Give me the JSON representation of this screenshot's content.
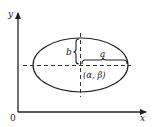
{
  "diagram": {
    "type": "ellipse-with-axes",
    "axes": {
      "x_label": "x",
      "y_label": "y",
      "origin_label": "0"
    },
    "ellipse": {
      "center_label": "(α, β)",
      "semi_major_label": "a",
      "semi_minor_label": "b"
    },
    "colors": {
      "stroke": "#222222",
      "background": "#ffffff"
    }
  }
}
